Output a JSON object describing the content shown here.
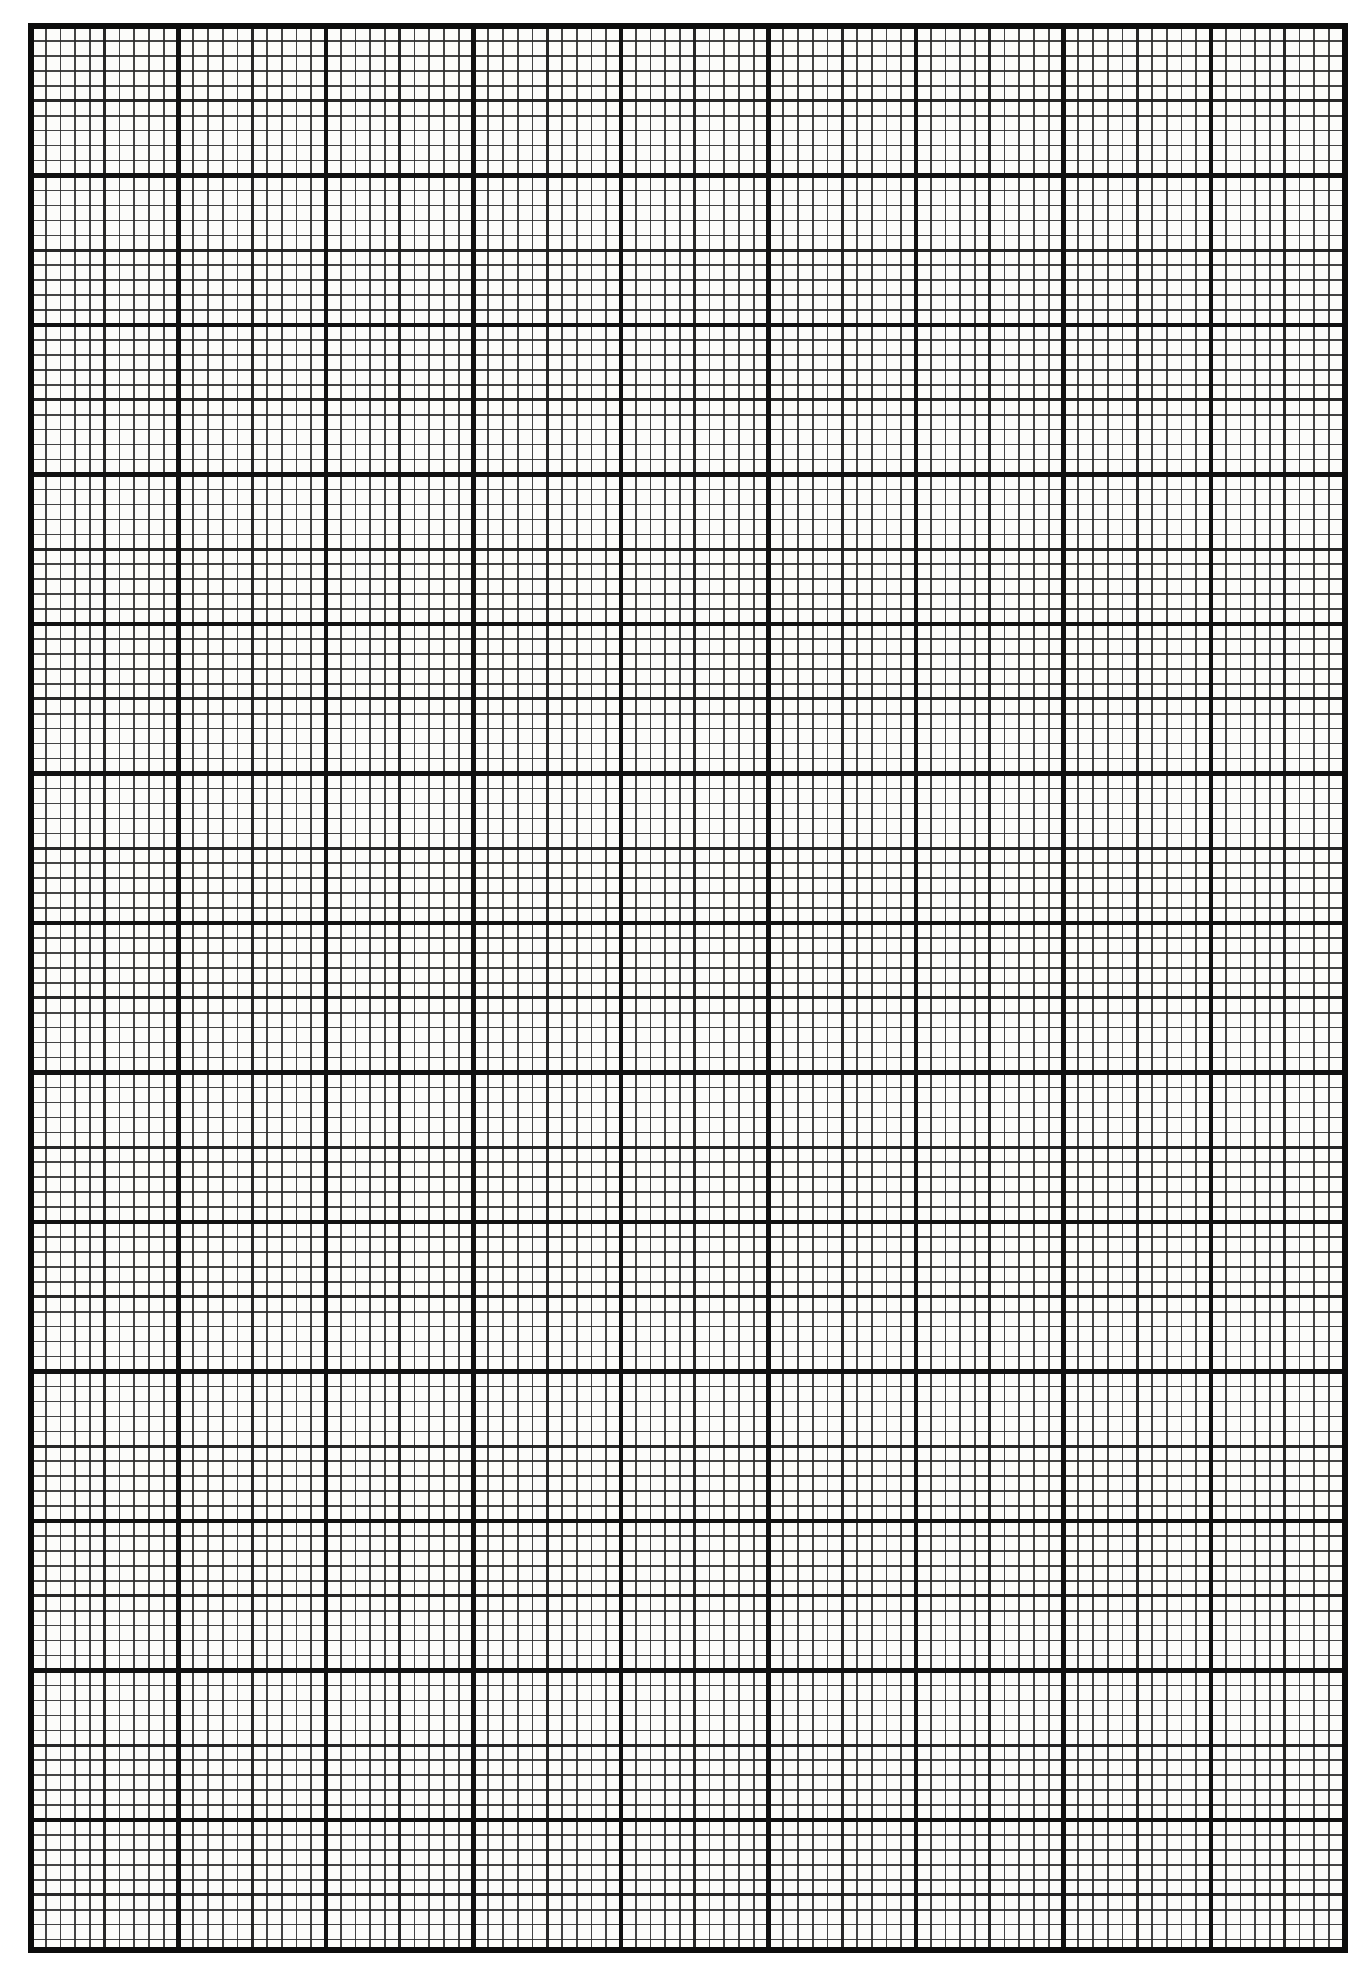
{
  "document": {
    "kind": "graph-paper",
    "title": "Graph Paper Grid Sheet",
    "orientation": "portrait",
    "page_width_px": 1368,
    "page_height_px": 1977,
    "background_color": "#ffffff",
    "paper_tint_color": "#fcfcfa"
  },
  "grid": {
    "origin_x_px": 31,
    "origin_y_px": 26,
    "right_edge_px": 1345,
    "bottom_edge_px": 1950,
    "minor_cell_width_px": 14.75,
    "minor_cell_height_px": 14.95,
    "minor_columns": 89,
    "minor_rows": 128,
    "major_every_n_cells": 10,
    "medium_every_n_cells": 5,
    "major_block_columns": 9,
    "major_block_rows": 13,
    "partial_last_column_cells": 9,
    "partial_last_row_cells": 8
  },
  "lines": {
    "minor": {
      "name": "minor-gridline",
      "color": "#2b2b2b",
      "width_px": 1.6,
      "opacity": 0.88
    },
    "medium": {
      "name": "medium-gridline",
      "color": "#1d1d1d",
      "width_px": 2.6,
      "opacity": 0.95
    },
    "major": {
      "name": "major-gridline",
      "color": "#111111",
      "width_px": 4.4,
      "opacity": 1
    },
    "border": {
      "name": "grid-border",
      "color": "#0d0d0d",
      "width_px": 5.2,
      "opacity": 1
    }
  },
  "labels": {
    "sheet_label": "",
    "margin_note": ""
  },
  "chart_data": {
    "type": "table",
    "xlabel": "",
    "ylabel": "",
    "grid": true,
    "legend": false,
    "categories": [],
    "values": []
  }
}
